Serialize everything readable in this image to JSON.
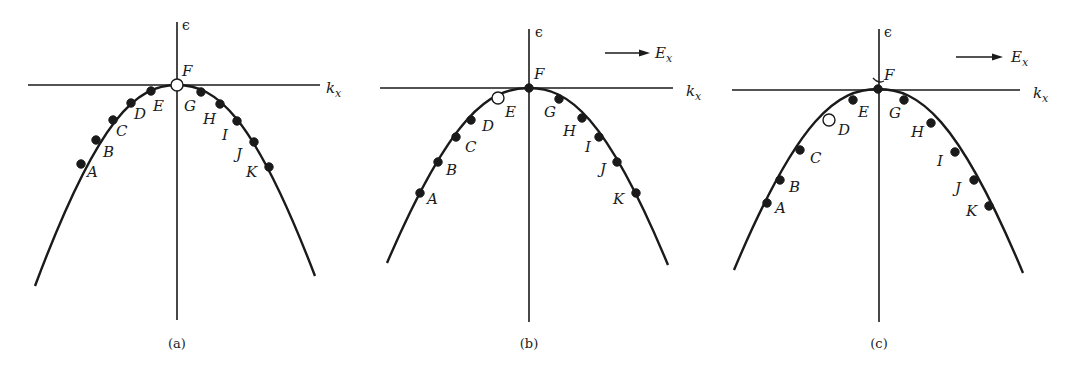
{
  "figure": {
    "description": "Energy band epsilon vs k_x near band maximum, showing filled electron states A-K and a hole; (b) and (c) under applied field E_x",
    "colors": {
      "ink": "#1a1a1a",
      "background": "#ffffff",
      "hole_fill": "#ffffff"
    },
    "panels": [
      {
        "id": "a",
        "caption": "(a)",
        "axis_origin": [
          177,
          85
        ],
        "h_axis": {
          "x1": 28,
          "x2": 320,
          "y": 85,
          "label": "k",
          "label_sub": "x",
          "label_pos": [
            326,
            93
          ]
        },
        "v_axis": {
          "x": 177,
          "y1": 22,
          "y2": 320,
          "label": "ϵ",
          "label_pos": [
            182,
            30
          ]
        },
        "field_arrow": null,
        "curve": {
          "left_end": [
            35,
            286
          ],
          "apex": [
            177,
            85
          ],
          "right_end": [
            315,
            276
          ]
        },
        "points": [
          {
            "name": "A",
            "x": 81,
            "y": 164,
            "state": "filled",
            "label_pos": [
              87,
              177
            ]
          },
          {
            "name": "B",
            "x": 96,
            "y": 140,
            "state": "filled",
            "label_pos": [
              103,
              157
            ]
          },
          {
            "name": "C",
            "x": 113,
            "y": 120,
            "state": "filled",
            "label_pos": [
              116,
              136
            ]
          },
          {
            "name": "D",
            "x": 131,
            "y": 103,
            "state": "filled",
            "label_pos": [
              134,
              119
            ]
          },
          {
            "name": "E",
            "x": 151,
            "y": 91,
            "state": "filled",
            "label_pos": [
              153,
              111
            ]
          },
          {
            "name": "F",
            "x": 177,
            "y": 85,
            "state": "empty",
            "label_pos": [
              182,
              76
            ]
          },
          {
            "name": "G",
            "x": 201,
            "y": 92,
            "state": "filled",
            "label_pos": [
              184,
              111
            ]
          },
          {
            "name": "H",
            "x": 220,
            "y": 104,
            "state": "filled",
            "label_pos": [
              203,
              124
            ]
          },
          {
            "name": "I",
            "x": 237,
            "y": 121,
            "state": "filled",
            "label_pos": [
              222,
              140
            ]
          },
          {
            "name": "J",
            "x": 254,
            "y": 142,
            "state": "filled",
            "label_pos": [
              236,
              159
            ]
          },
          {
            "name": "K",
            "x": 269,
            "y": 167,
            "state": "filled",
            "label_pos": [
              246,
              177
            ]
          }
        ]
      },
      {
        "id": "b",
        "caption": "(b)",
        "axis_origin": [
          529,
          88
        ],
        "h_axis": {
          "x1": 380,
          "x2": 673,
          "y": 88,
          "label": "k",
          "label_sub": "x",
          "label_pos": [
            686,
            96
          ]
        },
        "v_axis": {
          "x": 529,
          "y1": 29,
          "y2": 322,
          "label": "ϵ",
          "label_pos": [
            535,
            37
          ]
        },
        "field_arrow": {
          "x1": 605,
          "x2": 650,
          "y": 53,
          "label": "E",
          "label_sub": "x",
          "label_pos": [
            655,
            58
          ]
        },
        "curve": {
          "left_end": [
            387,
            263
          ],
          "apex": [
            529,
            88
          ],
          "right_end": [
            668,
            265
          ]
        },
        "points": [
          {
            "name": "A",
            "x": 420,
            "y": 193,
            "state": "filled",
            "label_pos": [
              427,
              204
            ]
          },
          {
            "name": "B",
            "x": 438,
            "y": 162,
            "state": "filled",
            "label_pos": [
              446,
              175
            ]
          },
          {
            "name": "C",
            "x": 456,
            "y": 137,
            "state": "filled",
            "label_pos": [
              465,
              152
            ]
          },
          {
            "name": "D",
            "x": 471,
            "y": 120,
            "state": "filled",
            "label_pos": [
              482,
              131
            ]
          },
          {
            "name": "E",
            "x": 498,
            "y": 98,
            "state": "empty",
            "label_pos": [
              505,
              117
            ]
          },
          {
            "name": "F",
            "x": 529,
            "y": 88,
            "state": "filled",
            "label_pos": [
              534,
              79
            ]
          },
          {
            "name": "G",
            "x": 559,
            "y": 99,
            "state": "filled",
            "label_pos": [
              544,
              117
            ]
          },
          {
            "name": "H",
            "x": 582,
            "y": 118,
            "state": "filled",
            "label_pos": [
              563,
              136
            ]
          },
          {
            "name": "I",
            "x": 599,
            "y": 137,
            "state": "filled",
            "label_pos": [
              585,
              152
            ]
          },
          {
            "name": "J",
            "x": 617,
            "y": 162,
            "state": "filled",
            "label_pos": [
              600,
              174
            ]
          },
          {
            "name": "K",
            "x": 636,
            "y": 193,
            "state": "filled",
            "label_pos": [
              613,
              204
            ]
          }
        ]
      },
      {
        "id": "c",
        "caption": "(c)",
        "axis_origin": [
          878,
          89
        ],
        "h_axis": {
          "x1": 732,
          "x2": 1020,
          "y": 90,
          "label": "k",
          "label_sub": "x",
          "label_pos": [
            1033,
            98
          ]
        },
        "v_axis": {
          "x": 879,
          "y1": 29,
          "y2": 322,
          "label": "ϵ",
          "label_pos": [
            884,
            37
          ]
        },
        "field_arrow": {
          "x1": 956,
          "x2": 1003,
          "y": 57,
          "label": "E",
          "label_sub": "x",
          "label_pos": [
            1011,
            62
          ]
        },
        "curve": {
          "left_end": [
            734,
            270
          ],
          "apex": [
            878,
            89
          ],
          "right_end": [
            1023,
            273
          ]
        },
        "points": [
          {
            "name": "A",
            "x": 767,
            "y": 203,
            "state": "filled",
            "label_pos": [
              775,
              213
            ]
          },
          {
            "name": "B",
            "x": 780,
            "y": 180,
            "state": "filled",
            "label_pos": [
              789,
              192
            ]
          },
          {
            "name": "C",
            "x": 800,
            "y": 150,
            "state": "filled",
            "label_pos": [
              810,
              163
            ]
          },
          {
            "name": "D",
            "x": 829,
            "y": 120,
            "state": "empty",
            "label_pos": [
              838,
              135
            ]
          },
          {
            "name": "E",
            "x": 853,
            "y": 100,
            "state": "filled",
            "label_pos": [
              858,
              117
            ]
          },
          {
            "name": "F",
            "x": 878,
            "y": 89,
            "state": "filled",
            "label_pos": [
              884,
              80
            ]
          },
          {
            "name": "G",
            "x": 904,
            "y": 100,
            "state": "filled",
            "label_pos": [
              889,
              118
            ]
          },
          {
            "name": "H",
            "x": 931,
            "y": 123,
            "state": "filled",
            "label_pos": [
              911,
              137
            ]
          },
          {
            "name": "I",
            "x": 955,
            "y": 152,
            "state": "filled",
            "label_pos": [
              937,
              166
            ]
          },
          {
            "name": "J",
            "x": 974,
            "y": 180,
            "state": "filled",
            "label_pos": [
              955,
              193
            ]
          },
          {
            "name": "K",
            "x": 989,
            "y": 206,
            "state": "filled",
            "label_pos": [
              966,
              216
            ]
          }
        ],
        "extra_mark": {
          "type": "small-arc",
          "x1": 873,
          "y1": 78,
          "x2": 884,
          "y2": 81
        }
      }
    ]
  }
}
